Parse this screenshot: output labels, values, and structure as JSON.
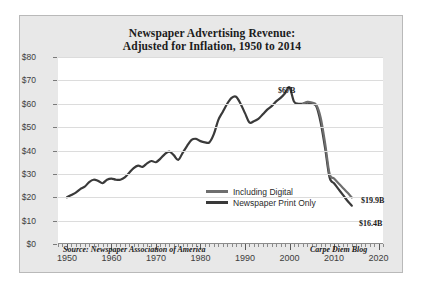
{
  "chart_data": {
    "type": "line",
    "title": "Newspaper Advertising Revenue:\nAdjusted for Inflation, 1950 to 2014",
    "title_line1": "Newspaper Advertising Revenue:",
    "title_line2": "Adjusted for Inflation, 1950 to 2014",
    "ylabel": "Billions of 2014 Dollars",
    "xlabel": "",
    "xlim": [
      1948,
      2021
    ],
    "ylim": [
      0,
      80
    ],
    "grid": true,
    "legend_position": "center",
    "ytick_labels": [
      "$0",
      "$10",
      "$20",
      "$30",
      "$40",
      "$50",
      "$60",
      "$70",
      "$80"
    ],
    "ytick_values": [
      0,
      10,
      20,
      30,
      40,
      50,
      60,
      70,
      80
    ],
    "xtick_labels": [
      "1950",
      "1960",
      "1970",
      "1980",
      "1990",
      "2000",
      "2010",
      "2020"
    ],
    "xtick_values": [
      1950,
      1960,
      1970,
      1980,
      1990,
      2000,
      2010,
      2020
    ],
    "annotations": [
      {
        "text": "$67B",
        "x": 2000,
        "y": 67
      },
      {
        "text": "$19.9B",
        "x": 2014,
        "y": 19.9
      },
      {
        "text": "$16.4B",
        "x": 2014,
        "y": 16.4
      }
    ],
    "source_note": "Source: Newspaper Association of America",
    "credit_note": "Carpe Diem Blog",
    "series": [
      {
        "name": "Including Digital",
        "color": "#6e6e6e",
        "x": [
          2003,
          2004,
          2005,
          2006,
          2007,
          2008,
          2009,
          2010,
          2011,
          2012,
          2013,
          2014
        ],
        "values": [
          60.0,
          60.8,
          60.5,
          59.5,
          54.0,
          43.0,
          30.0,
          28.0,
          26.0,
          24.0,
          22.0,
          19.9
        ]
      },
      {
        "name": "Newspaper Print Only",
        "color": "#3a3a3a",
        "x": [
          1950,
          1951,
          1952,
          1953,
          1954,
          1955,
          1956,
          1957,
          1958,
          1959,
          1960,
          1961,
          1962,
          1963,
          1964,
          1965,
          1966,
          1967,
          1968,
          1969,
          1970,
          1971,
          1972,
          1973,
          1974,
          1975,
          1976,
          1977,
          1978,
          1979,
          1980,
          1981,
          1982,
          1983,
          1984,
          1985,
          1986,
          1987,
          1988,
          1989,
          1990,
          1991,
          1992,
          1993,
          1994,
          1995,
          1996,
          1997,
          1998,
          1999,
          2000,
          2001,
          2002,
          2003,
          2004,
          2005,
          2006,
          2007,
          2008,
          2009,
          2010,
          2011,
          2012,
          2013,
          2014
        ],
        "values": [
          20.0,
          21.0,
          22.0,
          23.5,
          24.5,
          26.5,
          27.5,
          27.0,
          26.0,
          27.5,
          28.0,
          27.5,
          27.5,
          28.5,
          30.5,
          32.5,
          33.5,
          33.0,
          34.5,
          35.5,
          35.0,
          36.5,
          38.5,
          39.5,
          38.0,
          36.0,
          39.0,
          42.0,
          44.5,
          45.0,
          44.0,
          43.5,
          43.5,
          47.0,
          53.0,
          56.5,
          60.0,
          62.5,
          63.0,
          60.0,
          56.0,
          52.0,
          52.5,
          53.5,
          55.5,
          57.5,
          59.0,
          61.0,
          62.5,
          64.5,
          67.0,
          61.0,
          60.0,
          60.0,
          60.5,
          60.0,
          59.0,
          52.0,
          41.0,
          28.5,
          26.0,
          23.5,
          21.0,
          18.5,
          16.4
        ]
      }
    ]
  },
  "legend": {
    "items": [
      {
        "label": "Including Digital",
        "color": "#6e6e6e"
      },
      {
        "label": "Newspaper Print Only",
        "color": "#3a3a3a"
      }
    ]
  },
  "colors": {
    "background": "#e8e8e8",
    "plot_background": "#ffffff",
    "gridline": "#dcdcdc",
    "text": "#1b1b1b",
    "axis": "#8c8c8c"
  }
}
